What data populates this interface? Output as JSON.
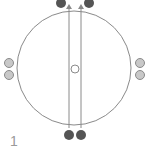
{
  "diagram": {
    "label": "1",
    "colors": {
      "line": "#8a8a8a",
      "dark_dot": "#555555",
      "light_dot_fill": "#c8c8c8",
      "light_dot_stroke": "#8a8a8a",
      "center_fill": "#ffffff",
      "label": "#9a9a9a"
    },
    "elements": {
      "outer_circle": "large circle",
      "vertical_lines": 2,
      "top_dots": 2,
      "bottom_dots": 2,
      "left_dots": 2,
      "right_dots": 2,
      "center_marker": "open circle",
      "arrowheads": 2
    }
  }
}
